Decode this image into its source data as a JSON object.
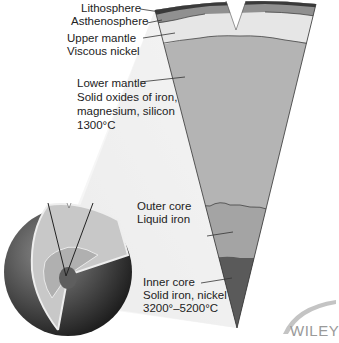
{
  "diagram": {
    "labels": [
      {
        "id": "lithosphere",
        "lines": [
          "Lithosphere"
        ]
      },
      {
        "id": "asthenosphere",
        "lines": [
          "Asthenosphere"
        ]
      },
      {
        "id": "upper-mantle",
        "lines": [
          "Upper mantle",
          "Viscous nickel"
        ]
      },
      {
        "id": "lower-mantle",
        "lines": [
          "Lower mantle",
          "Solid oxides of iron,",
          "magnesium, silicon",
          "1300°C"
        ]
      },
      {
        "id": "outer-core",
        "lines": [
          "Outer core",
          "Liquid iron"
        ]
      },
      {
        "id": "inner-core",
        "lines": [
          "Inner core",
          "Solid iron, nickel",
          "3200°–5200°C"
        ]
      }
    ],
    "colors": {
      "lithosphere": "#3a3a3a",
      "asthenosphere": "#8c8c8c",
      "upper_mantle": "#e4e4e4",
      "lower_mantle": "#b4b4b4",
      "outer_core": "#9c9c9c",
      "inner_core": "#5a5a5a",
      "globe_surface": "#4a4a4a"
    }
  },
  "branding": {
    "publisher": "WILEY"
  }
}
